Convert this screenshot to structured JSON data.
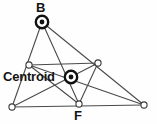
{
  "figure": {
    "width": 157,
    "height": 124,
    "background_color": "#fefefe",
    "line_color": "#4a4a4a",
    "marker_fill": "#ffffff",
    "marker_stroke": "#3a3a3a",
    "highlight_color": "#111111",
    "text_color": "#141414"
  },
  "labels": {
    "vertex_b": "B",
    "vertex_f": "F",
    "centroid": "Centroid"
  },
  "points": {
    "B": {
      "name": "B",
      "x": 42,
      "y": 22,
      "marker": "bullseye"
    },
    "A": {
      "name": "A",
      "x": 12,
      "y": 107,
      "marker": "open-circle"
    },
    "C": {
      "name": "C",
      "x": 144,
      "y": 105,
      "marker": "open-circle"
    },
    "D": {
      "name": "D",
      "x": 29,
      "y": 65,
      "marker": "open-circle"
    },
    "E": {
      "name": "E",
      "x": 98,
      "y": 63,
      "marker": "open-circle"
    },
    "F": {
      "name": "F",
      "x": 79,
      "y": 104,
      "marker": "open-circle"
    },
    "G": {
      "name": "Centroid",
      "x": 71,
      "y": 77,
      "marker": "bullseye"
    }
  },
  "segments": [
    {
      "name": "side-AB",
      "x1": 12,
      "y1": 107,
      "x2": 42,
      "y2": 22
    },
    {
      "name": "side-BC",
      "x1": 42,
      "y1": 22,
      "x2": 144,
      "y2": 105
    },
    {
      "name": "side-AC",
      "x1": 12,
      "y1": 107,
      "x2": 144,
      "y2": 105
    },
    {
      "name": "median-B-F",
      "x1": 42,
      "y1": 22,
      "x2": 79,
      "y2": 104
    },
    {
      "name": "median-A-E",
      "x1": 12,
      "y1": 107,
      "x2": 98,
      "y2": 63
    },
    {
      "name": "median-C-D",
      "x1": 144,
      "y1": 105,
      "x2": 29,
      "y2": 65
    },
    {
      "name": "midline-D-E",
      "x1": 29,
      "y1": 65,
      "x2": 98,
      "y2": 63
    },
    {
      "name": "midline-D-F",
      "x1": 29,
      "y1": 65,
      "x2": 79,
      "y2": 104
    },
    {
      "name": "midline-E-F",
      "x1": 98,
      "y1": 63,
      "x2": 79,
      "y2": 104
    }
  ],
  "label_positions": {
    "vertex_b": {
      "x": 36,
      "y": 1
    },
    "vertex_f": {
      "x": 74,
      "y": 109
    },
    "centroid": {
      "x": 3,
      "y": 70
    }
  }
}
